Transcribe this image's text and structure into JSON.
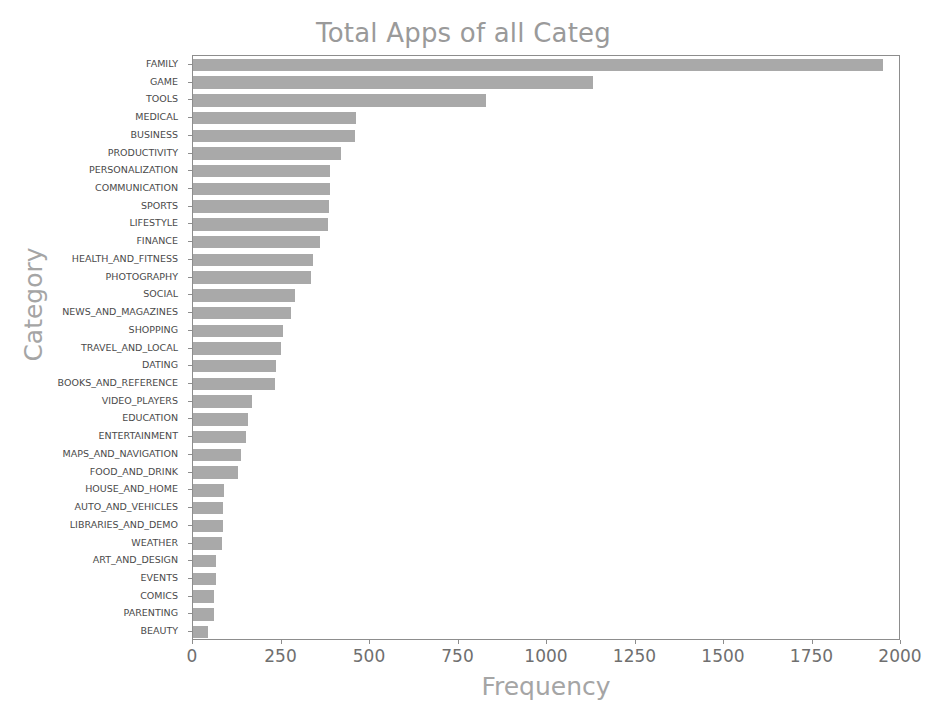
{
  "chart_data": {
    "type": "bar",
    "orientation": "horizontal",
    "title": "Total Apps of all Categ",
    "xlabel": "Frequency",
    "ylabel": "Category",
    "xlim": [
      0,
      2000
    ],
    "xticks": [
      0,
      250,
      500,
      750,
      1000,
      1250,
      1500,
      1750,
      2000
    ],
    "xtick_labels": [
      "0",
      "250",
      "500",
      "750",
      "1000",
      "1250",
      "1500",
      "1750",
      "2000"
    ],
    "grid": false,
    "legend": null,
    "bar_color": "#a9a9a9",
    "title_color": "#9a9a9a",
    "axis_label_color": "#a5a5a5",
    "categories": [
      "FAMILY",
      "GAME",
      "TOOLS",
      "MEDICAL",
      "BUSINESS",
      "PRODUCTIVITY",
      "PERSONALIZATION",
      "COMMUNICATION",
      "SPORTS",
      "LIFESTYLE",
      "FINANCE",
      "HEALTH_AND_FITNESS",
      "PHOTOGRAPHY",
      "SOCIAL",
      "NEWS_AND_MAGAZINES",
      "SHOPPING",
      "TRAVEL_AND_LOCAL",
      "DATING",
      "BOOKS_AND_REFERENCE",
      "VIDEO_PLAYERS",
      "EDUCATION",
      "ENTERTAINMENT",
      "MAPS_AND_NAVIGATION",
      "FOOD_AND_DRINK",
      "HOUSE_AND_HOME",
      "AUTO_AND_VEHICLES",
      "LIBRARIES_AND_DEMO",
      "WEATHER",
      "ART_AND_DESIGN",
      "EVENTS",
      "COMICS",
      "PARENTING",
      "BEAUTY"
    ],
    "values": [
      1956,
      1133,
      830,
      463,
      460,
      420,
      389,
      387,
      384,
      382,
      360,
      341,
      335,
      290,
      277,
      255,
      250,
      234,
      231,
      167,
      156,
      149,
      137,
      127,
      88,
      85,
      85,
      82,
      65,
      64,
      60,
      60,
      42
    ]
  }
}
